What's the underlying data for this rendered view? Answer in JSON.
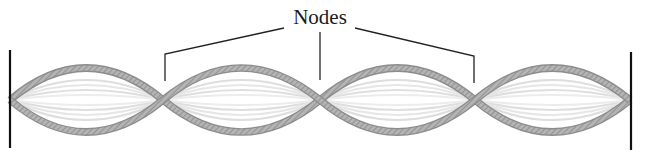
{
  "diagram": {
    "type": "standing-wave",
    "label": "Nodes",
    "node_count": 3,
    "loop_count": 4,
    "fixed_ends": [
      "left-wall",
      "right-wall"
    ],
    "colors": {
      "background": "#ffffff",
      "rope": "#9a9a9a",
      "rope_highlight": "#d4d4d4",
      "ghost_strings": "#dcdcdc",
      "walls": "#111111",
      "leader_lines": "#222222",
      "label": "#1a1a1a"
    }
  }
}
